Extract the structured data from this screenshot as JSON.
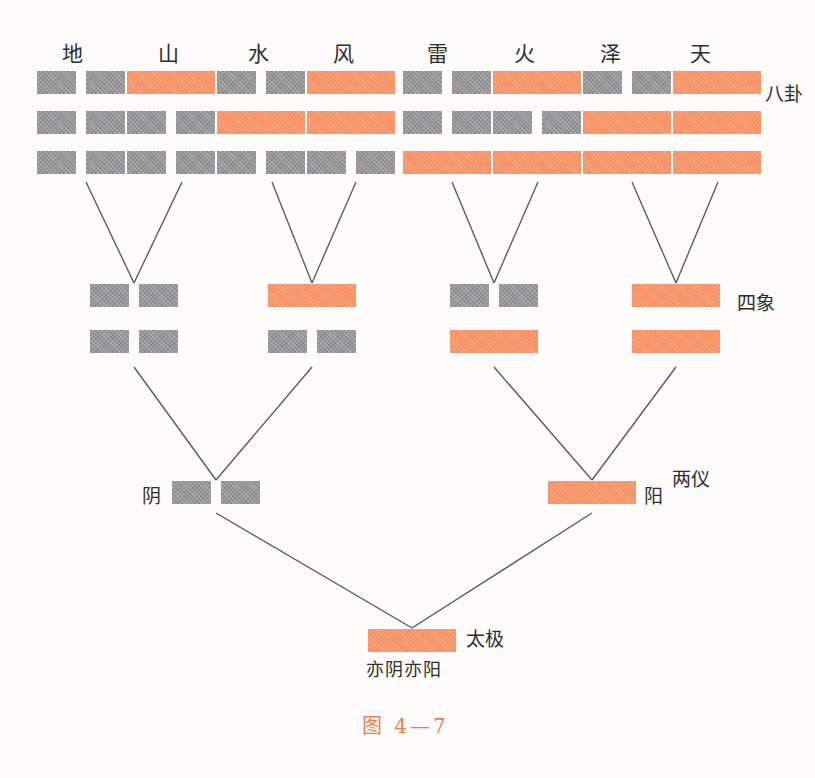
{
  "figure": {
    "caption": "图 4—7",
    "caption_color": "#ef7f55"
  },
  "colors": {
    "yang": "#f79568",
    "yin": "#97979a",
    "line": "#58585a",
    "text": "#2e2e2e",
    "background": "#fdfcfa"
  },
  "level_labels": {
    "bagua": "八卦",
    "sixiang": "四象",
    "liangyi": "两仪",
    "taiji": "太极"
  },
  "bagua": {
    "names": [
      "地",
      "山",
      "水",
      "风",
      "雷",
      "火",
      "泽",
      "天"
    ],
    "lines": [
      {
        "name": "地",
        "top": "yin",
        "middle": "yin",
        "bottom": "yin"
      },
      {
        "name": "山",
        "top": "yang",
        "middle": "yin",
        "bottom": "yin"
      },
      {
        "name": "水",
        "top": "yin",
        "middle": "yang",
        "bottom": "yin"
      },
      {
        "name": "风",
        "top": "yang",
        "middle": "yang",
        "bottom": "yin"
      },
      {
        "name": "雷",
        "top": "yin",
        "middle": "yin",
        "bottom": "yang"
      },
      {
        "name": "火",
        "top": "yang",
        "middle": "yin",
        "bottom": "yang"
      },
      {
        "name": "泽",
        "top": "yin",
        "middle": "yang",
        "bottom": "yang"
      },
      {
        "name": "天",
        "top": "yang",
        "middle": "yang",
        "bottom": "yang"
      }
    ]
  },
  "sixiang": [
    {
      "index": 1,
      "top": "yin",
      "bottom": "yin"
    },
    {
      "index": 2,
      "top": "yang",
      "bottom": "yin"
    },
    {
      "index": 3,
      "top": "yin",
      "bottom": "yang"
    },
    {
      "index": 4,
      "top": "yang",
      "bottom": "yang"
    }
  ],
  "liangyi": [
    {
      "label": "阴",
      "type": "yin"
    },
    {
      "label": "阳",
      "type": "yang"
    }
  ],
  "taiji": {
    "type": "yang",
    "sub_label": "亦阴亦阳",
    "side_label": "太极"
  }
}
